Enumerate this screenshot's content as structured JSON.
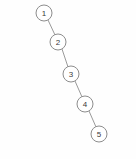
{
  "diagram": {
    "kind": "tree-diagram",
    "canvas": {
      "width": 136,
      "height": 159,
      "background": "#fefefe"
    },
    "style": {
      "node_fill": "#ffffff",
      "node_stroke": "#8d8d8d",
      "node_radius": 8,
      "edge_stroke": "#9a9a9a",
      "label_color": "#3a3a3a"
    },
    "nodes": [
      {
        "id": "n1",
        "label": "1",
        "cx": 44,
        "cy": 13,
        "r": 8
      },
      {
        "id": "n2",
        "label": "2",
        "cx": 58,
        "cy": 42,
        "r": 8
      },
      {
        "id": "n3",
        "label": "3",
        "cx": 71,
        "cy": 74,
        "r": 8
      },
      {
        "id": "n4",
        "label": "4",
        "cx": 85,
        "cy": 104,
        "r": 8
      },
      {
        "id": "n5",
        "label": "5",
        "cx": 99,
        "cy": 134,
        "r": 8
      }
    ],
    "edges": [
      {
        "id": "e1",
        "from": "n1",
        "to": "n2",
        "x1": 48,
        "y1": 20,
        "x2": 55,
        "y2": 35
      },
      {
        "id": "e2",
        "from": "n2",
        "to": "n3",
        "x1": 62,
        "y1": 49,
        "x2": 68,
        "y2": 67
      },
      {
        "id": "e3",
        "from": "n3",
        "to": "n4",
        "x1": 75,
        "y1": 81,
        "x2": 82,
        "y2": 97
      },
      {
        "id": "e4",
        "from": "n4",
        "to": "n5",
        "x1": 89,
        "y1": 111,
        "x2": 96,
        "y2": 127
      }
    ]
  }
}
